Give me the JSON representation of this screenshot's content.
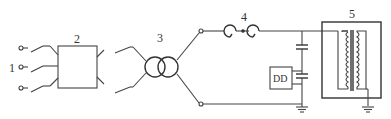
{
  "diagram": {
    "type": "circuit-schematic",
    "labels": {
      "input_terminals": "1",
      "switchgear_box": "2",
      "transformer": "3",
      "reactor": "4",
      "test_object": "5",
      "detector": "DD"
    },
    "components": [
      {
        "id": "1",
        "name": "three-phase input terminals"
      },
      {
        "id": "2",
        "name": "switch/control box"
      },
      {
        "id": "3",
        "name": "two-winding transformer"
      },
      {
        "id": "4",
        "name": "series reactor (coupled inductors)"
      },
      {
        "id": "5",
        "name": "shielded transformer under test"
      },
      {
        "id": "DD",
        "name": "detection device with coupling capacitor divider"
      }
    ]
  }
}
